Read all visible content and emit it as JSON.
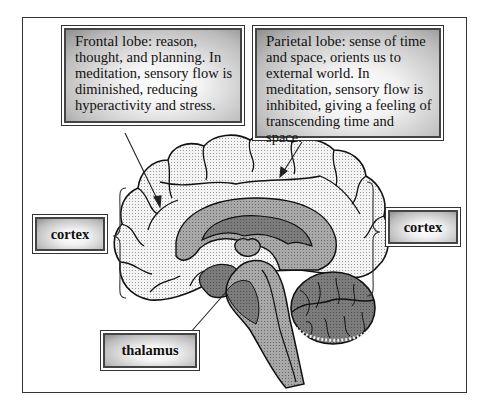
{
  "diagram": {
    "callouts": {
      "frontal": {
        "title": "Frontal lobe:",
        "text": " reason, thought, and planning. In meditation, sensory flow is diminished, reducing hyperactivity and stress."
      },
      "parietal": {
        "title": "Parietal lobe:",
        "text": " sense of time and space, orients us to external world. In meditation, sensory flow is inhibited, giving a feeling of transcending time and space."
      }
    },
    "labels": {
      "cortex_left": "cortex",
      "cortex_right": "cortex",
      "thalamus": "thalamus"
    },
    "colors": {
      "cortex_fill": "#e6e6e6",
      "inner_fill": "#9a9a9a",
      "deep_fill": "#6e6e6e",
      "stem_fill": "#a5a5a5",
      "cerebellum_fill": "#707070",
      "outline": "#111111"
    }
  }
}
